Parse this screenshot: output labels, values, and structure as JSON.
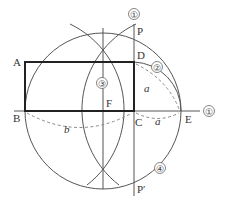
{
  "diagram": {
    "type": "geometric-construction",
    "points": {
      "A": {
        "label": "A",
        "x": 25,
        "y": 62
      },
      "B": {
        "label": "B",
        "x": 25,
        "y": 111
      },
      "C": {
        "label": "C",
        "x": 134,
        "y": 111
      },
      "D": {
        "label": "D",
        "x": 134,
        "y": 62
      },
      "E": {
        "label": "E",
        "x": 181,
        "y": 111
      },
      "F": {
        "label": "F",
        "x": 103,
        "y": 111
      },
      "P": {
        "label": "P",
        "x": 134,
        "y": 36
      },
      "P_prime": {
        "label": "P′",
        "x": 134,
        "y": 186
      }
    },
    "segment_labels": {
      "a_vertical": "a",
      "a_horizontal": "a",
      "b": "b"
    },
    "step_markers": {
      "step1_vertical": "①",
      "step1_horizontal": "①",
      "step2": "②",
      "step3": "③",
      "step4": "④"
    },
    "colors": {
      "line": "#555555",
      "rectangle": "#222222",
      "dashed": "#888888",
      "text": "#333333"
    }
  }
}
